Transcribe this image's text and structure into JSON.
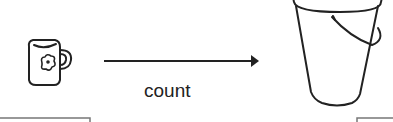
{
  "diagram": {
    "source": {
      "icon": "mug-icon",
      "description": "mug with flower"
    },
    "arrow": {
      "label": "count",
      "direction": "right"
    },
    "target": {
      "icon": "bucket-icon",
      "description": "bucket with handle"
    }
  },
  "colors": {
    "stroke": "#222222",
    "frame": "#777777",
    "background": "#ffffff"
  }
}
